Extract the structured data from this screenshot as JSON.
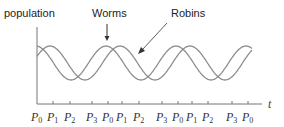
{
  "chart_data": {
    "type": "line",
    "title": "",
    "xlabel": "t",
    "ylabel": "population",
    "annotations": [
      "Worms",
      "Robins"
    ],
    "series": [
      {
        "name": "Worms",
        "phase": "peaks at P0",
        "period_ticks": [
          "P0",
          "P1",
          "P2",
          "P3"
        ],
        "peaks_at": [
          "P0",
          "P0",
          "P0",
          "P0"
        ],
        "troughs_at": [
          "P2",
          "P2",
          "P2"
        ]
      },
      {
        "name": "Robins",
        "phase": "peaks at P1",
        "peaks_at": [
          "P1",
          "P1",
          "P1"
        ],
        "troughs_at": [
          "P3",
          "P3",
          "P3"
        ]
      }
    ],
    "x_ticks": [
      "P0",
      "P1",
      "P2",
      "P3",
      "P0",
      "P1",
      "P2",
      "P3",
      "P0",
      "P1",
      "P2",
      "P3",
      "P0"
    ],
    "grid": false,
    "legend": "none (arrow annotations)"
  },
  "labels": {
    "ylabel": "population",
    "xlabel": "t",
    "worms": "Worms",
    "robins": "Robins"
  },
  "ticks": [
    {
      "label": "P",
      "sub": "0",
      "x": 37
    },
    {
      "label": "P",
      "sub": "1",
      "x": 53
    },
    {
      "label": "P",
      "sub": "2",
      "x": 70
    },
    {
      "label": "P",
      "sub": "3",
      "x": 92
    },
    {
      "label": "P",
      "sub": "0",
      "x": 108
    },
    {
      "label": "P",
      "sub": "1",
      "x": 122
    },
    {
      "label": "P",
      "sub": "2",
      "x": 139
    },
    {
      "label": "P",
      "sub": "3",
      "x": 162
    },
    {
      "label": "P",
      "sub": "0",
      "x": 178
    },
    {
      "label": "P",
      "sub": "1",
      "x": 192
    },
    {
      "label": "P",
      "sub": "2",
      "x": 208
    },
    {
      "label": "P",
      "sub": "3",
      "x": 232
    },
    {
      "label": "P",
      "sub": "0",
      "x": 248
    }
  ],
  "colors": {
    "curve": "#8c8c8c",
    "axis": "#666666",
    "text": "#222222"
  }
}
